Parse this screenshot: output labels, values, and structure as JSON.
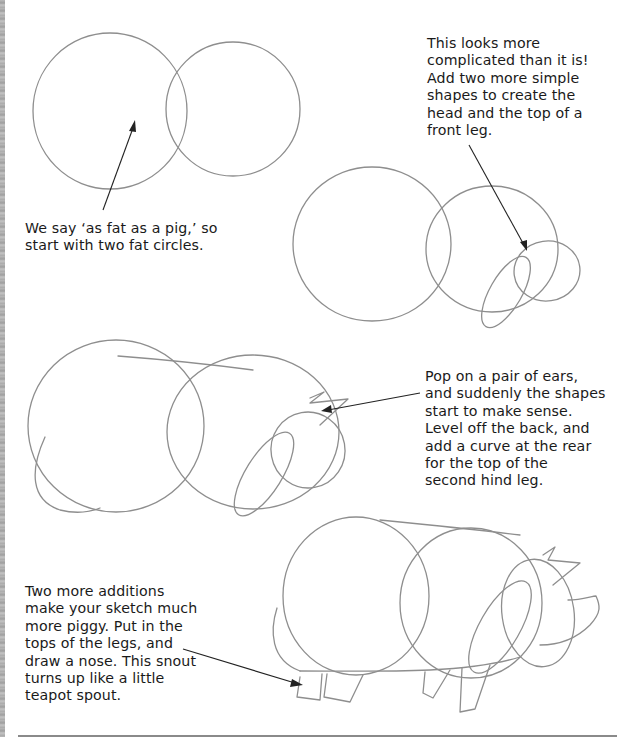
{
  "page": {
    "type": "drawing-tutorial",
    "subject": "pig",
    "accent_colors": {
      "pencil": "#8e8e8e",
      "text": "#1a1a1a",
      "arrow": "#222222",
      "background": "#ffffff"
    }
  },
  "steps": [
    {
      "step": 1,
      "caption_lines": [
        "We say ‘as fat as a pig,’ so",
        "start with two fat circles."
      ]
    },
    {
      "step": 2,
      "caption_lines": [
        "This looks more",
        "complicated than it is!",
        "Add two more simple",
        "shapes to create the",
        "head and the top of a",
        "front leg."
      ]
    },
    {
      "step": 3,
      "caption_lines": [
        "Pop on a pair of ears,",
        "and suddenly the shapes",
        "start to make sense.",
        "Level off the back, and",
        "add a curve at the rear",
        "for the top of the",
        "second hind leg."
      ]
    },
    {
      "step": 4,
      "caption_lines": [
        "Two more additions",
        "make your sketch much",
        "more piggy. Put in the",
        "tops of the legs, and",
        "draw a nose. This snout",
        "turns up like a little",
        "teapot spout."
      ]
    }
  ]
}
